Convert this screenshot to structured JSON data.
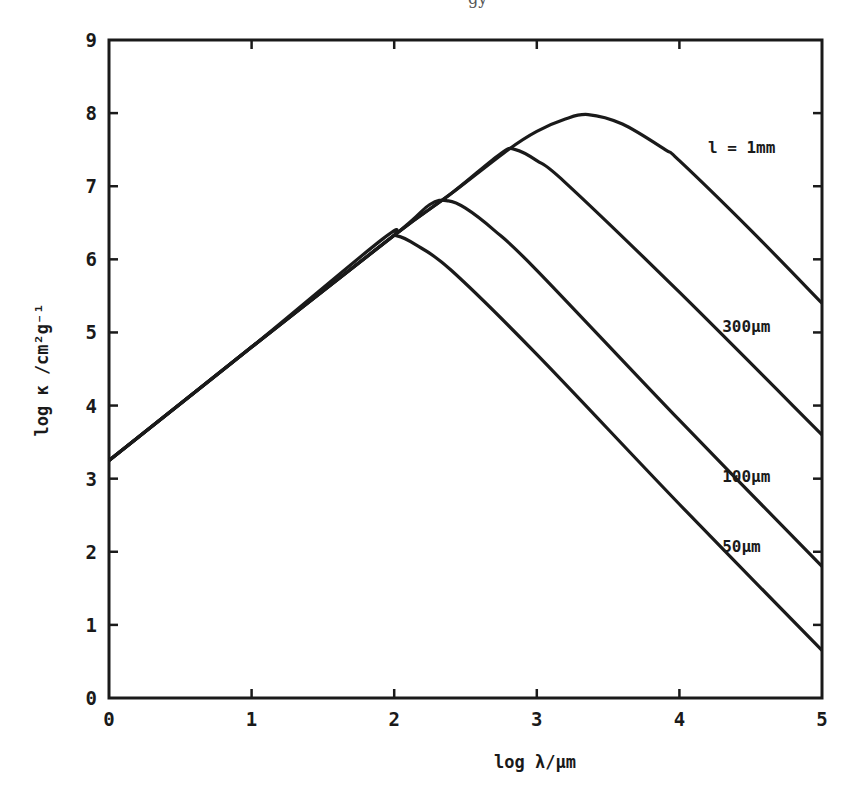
{
  "page_header_fragment": "gy",
  "chart_data": {
    "type": "line",
    "title": "",
    "xlabel": "log λ/μm",
    "ylabel": "log κ /cm²g⁻¹",
    "xlim": [
      0,
      5
    ],
    "ylim": [
      0,
      9
    ],
    "xticks": [
      0,
      1,
      2,
      3,
      4,
      5
    ],
    "yticks": [
      0,
      1,
      2,
      3,
      4,
      5,
      6,
      7,
      8,
      9
    ],
    "grid": false,
    "legend": "inline labels at right",
    "series": [
      {
        "name": "l = 1mm",
        "label": "l = 1mm",
        "label_pos": [
          4.2,
          7.45
        ],
        "points": [
          [
            0,
            3.25
          ],
          [
            1,
            4.8
          ],
          [
            2,
            6.33
          ],
          [
            2.4,
            6.9
          ],
          [
            2.8,
            7.5
          ],
          [
            3.0,
            7.75
          ],
          [
            3.2,
            7.92
          ],
          [
            3.36,
            7.98
          ],
          [
            3.6,
            7.85
          ],
          [
            3.9,
            7.5
          ],
          [
            4.0,
            7.35
          ],
          [
            4.5,
            6.4
          ],
          [
            5.0,
            5.4
          ]
        ]
      },
      {
        "name": "300μm",
        "label": "300μm",
        "label_pos": [
          4.3,
          5.0
        ],
        "points": [
          [
            0,
            3.25
          ],
          [
            1,
            4.8
          ],
          [
            2,
            6.33
          ],
          [
            2.4,
            6.9
          ],
          [
            2.75,
            7.45
          ],
          [
            2.85,
            7.5
          ],
          [
            3.0,
            7.35
          ],
          [
            3.2,
            7.05
          ],
          [
            4.0,
            5.55
          ],
          [
            5.0,
            3.6
          ]
        ]
      },
      {
        "name": "100μm",
        "label": "100μm",
        "label_pos": [
          4.3,
          2.95
        ],
        "points": [
          [
            0,
            3.25
          ],
          [
            1,
            4.8
          ],
          [
            2,
            6.33
          ],
          [
            2.25,
            6.75
          ],
          [
            2.38,
            6.8
          ],
          [
            2.5,
            6.7
          ],
          [
            2.7,
            6.4
          ],
          [
            3.0,
            5.85
          ],
          [
            4.0,
            3.8
          ],
          [
            5.0,
            1.8
          ]
        ]
      },
      {
        "name": "50μm",
        "label": "50μm",
        "label_pos": [
          4.3,
          2.0
        ],
        "points": [
          [
            0,
            3.25
          ],
          [
            1,
            4.8
          ],
          [
            1.92,
            6.28
          ],
          [
            2.02,
            6.32
          ],
          [
            2.15,
            6.2
          ],
          [
            2.4,
            5.85
          ],
          [
            3.0,
            4.7
          ],
          [
            4.0,
            2.65
          ],
          [
            5.0,
            0.65
          ]
        ]
      }
    ]
  },
  "axes": {
    "x_title": "log λ/μm",
    "y_title": "log κ /cm²g⁻¹"
  }
}
